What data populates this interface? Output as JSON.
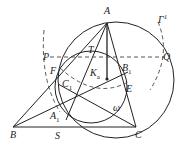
{
  "diagram": {
    "type": "geometry-figure",
    "points": [
      {
        "id": "A",
        "label": "A",
        "x": 107,
        "y": 23
      },
      {
        "id": "B",
        "label": "B",
        "x": 13,
        "y": 127
      },
      {
        "id": "C",
        "label": "C",
        "x": 136,
        "y": 127
      },
      {
        "id": "P",
        "label": "P",
        "x": 55,
        "y": 57
      },
      {
        "id": "Q",
        "label": "Q",
        "x": 161,
        "y": 57
      },
      {
        "id": "T",
        "label": "T",
        "x": 92,
        "y": 57
      },
      {
        "id": "Ka",
        "label": "K",
        "sub": "a",
        "x": 107,
        "y": 79
      },
      {
        "id": "B1",
        "label": "B",
        "sub": "1",
        "x": 121,
        "y": 64
      },
      {
        "id": "E",
        "label": "E",
        "x": 125,
        "y": 83
      },
      {
        "id": "F",
        "label": "F",
        "x": 58,
        "y": 71
      },
      {
        "id": "C1",
        "label": "C",
        "sub": "1",
        "x": 74,
        "y": 90
      },
      {
        "id": "A1",
        "label": "A",
        "sub": "1",
        "x": 62,
        "y": 118
      },
      {
        "id": "S",
        "label": "S",
        "x": 58,
        "y": 127
      }
    ],
    "curves": [
      {
        "id": "Gamma",
        "label": "Γ",
        "sup": "1",
        "style": "dashed"
      },
      {
        "id": "omega",
        "label": "ω",
        "style": "solid"
      },
      {
        "id": "circumcircle",
        "style": "solid"
      }
    ],
    "labels": {
      "A": "A",
      "B": "B",
      "C": "C",
      "P": "P",
      "Q": "Q",
      "T": "T",
      "K": "K",
      "a": "a",
      "B1": "B",
      "one": "1",
      "E": "E",
      "F": "F",
      "C1": "C",
      "A1": "A",
      "S": "S",
      "omega": "ω",
      "Gamma": "Γ"
    }
  }
}
